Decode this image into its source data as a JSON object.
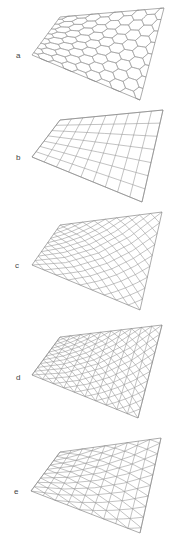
{
  "figure": {
    "line_color": "#9a9a9a",
    "outline_color": "#888888",
    "panels": [
      {
        "label": "a",
        "pattern": "hexagonal",
        "label_pos": [
          16,
          52
        ],
        "corners": {
          "tl": [
            60,
            17
          ],
          "tr": [
            164,
            8
          ],
          "br": [
            140,
            100
          ],
          "bl": [
            32,
            55
          ]
        },
        "cols": 9,
        "rows": 8
      },
      {
        "label": "b",
        "pattern": "quadrilateral",
        "label_pos": [
          16,
          154
        ],
        "corners": {
          "tl": [
            60,
            120
          ],
          "tr": [
            163,
            110
          ],
          "br": [
            142,
            202
          ],
          "bl": [
            32,
            157
          ]
        },
        "cols": 9,
        "rows": 7
      },
      {
        "label": "c",
        "pattern": "diamond",
        "label_pos": [
          15,
          262
        ],
        "corners": {
          "tl": [
            60,
            225
          ],
          "tr": [
            162,
            212
          ],
          "br": [
            140,
            310
          ],
          "bl": [
            32,
            265
          ]
        },
        "cols": 9,
        "rows": 9
      },
      {
        "label": "d",
        "pattern": "kagome",
        "label_pos": [
          16,
          374
        ],
        "corners": {
          "tl": [
            60,
            337
          ],
          "tr": [
            162,
            325
          ],
          "br": [
            138,
            418
          ],
          "bl": [
            32,
            375
          ]
        },
        "cols": 10,
        "rows": 10
      },
      {
        "label": "e",
        "pattern": "triangular",
        "label_pos": [
          14,
          488
        ],
        "corners": {
          "tl": [
            60,
            452
          ],
          "tr": [
            161,
            438
          ],
          "br": [
            140,
            533
          ],
          "bl": [
            31,
            491
          ]
        },
        "cols": 9,
        "rows": 9
      }
    ]
  }
}
